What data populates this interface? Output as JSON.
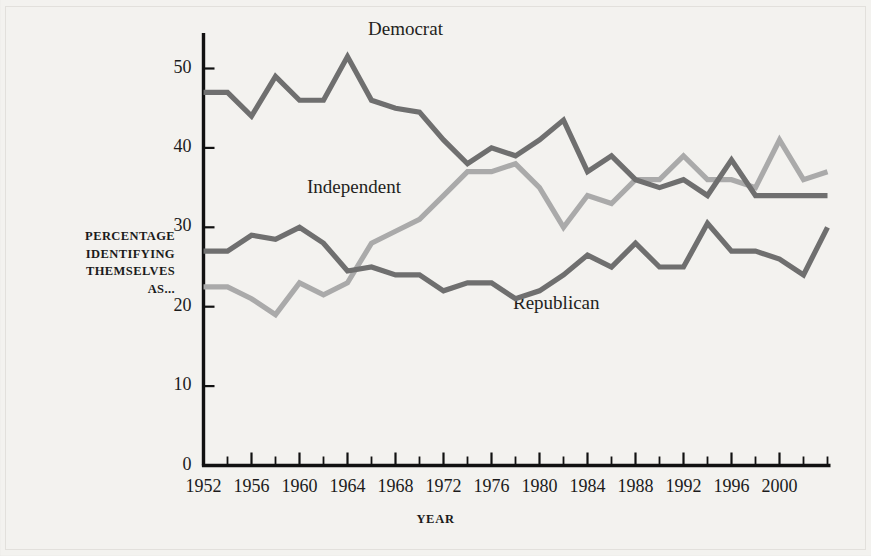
{
  "chart_data": {
    "type": "line",
    "title": "",
    "xlabel": "YEAR",
    "ylabel": "PERCENTAGE IDENTIFYING THEMSELVES AS...",
    "ylabel_lines": [
      "PERCENTAGE",
      "IDENTIFYING",
      "THEMSELVES",
      "AS..."
    ],
    "grid": false,
    "legend_position": "inline-annotations",
    "xlim": [
      1952,
      2004
    ],
    "ylim": [
      0,
      53
    ],
    "yticks": [
      0,
      10,
      20,
      30,
      40,
      50
    ],
    "ytick_labels": [
      "0",
      "10",
      "20",
      "30",
      "40",
      "50"
    ],
    "xtick_labels": [
      "1952",
      "1956",
      "1960",
      "1964",
      "1968",
      "1972",
      "1976",
      "1980",
      "1984",
      "1988",
      "1992",
      "1996",
      "2000"
    ],
    "xtick_label_years": [
      1952,
      1956,
      1960,
      1964,
      1968,
      1972,
      1976,
      1980,
      1984,
      1988,
      1992,
      1996,
      2000
    ],
    "xticks_minor_years": [
      1952,
      1954,
      1956,
      1958,
      1960,
      1962,
      1964,
      1966,
      1968,
      1970,
      1972,
      1974,
      1976,
      1978,
      1980,
      1982,
      1984,
      1986,
      1988,
      1990,
      1992,
      1994,
      1996,
      1998,
      2000,
      2002,
      2004
    ],
    "x": [
      1952,
      1954,
      1956,
      1958,
      1960,
      1962,
      1964,
      1966,
      1968,
      1970,
      1972,
      1974,
      1976,
      1978,
      1980,
      1982,
      1984,
      1986,
      1988,
      1990,
      1992,
      1994,
      1996,
      1998,
      2000,
      2002,
      2004
    ],
    "series": [
      {
        "name": "Democrat",
        "color": "#6f6f6f",
        "values": [
          47,
          47,
          44,
          49,
          46,
          46,
          51.5,
          46,
          45,
          44.5,
          41,
          38,
          40,
          39,
          41,
          43.5,
          37,
          39,
          36,
          35,
          36,
          34,
          38.5,
          34,
          34,
          34,
          34
        ]
      },
      {
        "name": "Independent",
        "color": "#aaaaaa",
        "values": [
          22.5,
          22.5,
          21,
          19,
          23,
          21.5,
          23,
          28,
          29.5,
          31,
          34,
          37,
          37,
          38,
          35,
          30,
          34,
          33,
          36,
          36,
          39,
          36,
          36,
          35,
          41,
          36,
          37
        ]
      },
      {
        "name": "Republican",
        "color": "#6f6f6f",
        "values": [
          27,
          27,
          29,
          28.5,
          30,
          28,
          24.5,
          25,
          24,
          24,
          22,
          23,
          23,
          21,
          22,
          24,
          26.5,
          25,
          28,
          25,
          25,
          30.5,
          27,
          27,
          26,
          24,
          30
        ]
      }
    ],
    "annotations": [
      {
        "text": "Democrat",
        "x": 1966,
        "y": 51
      },
      {
        "text": "Independent",
        "x": 1958,
        "y": 36
      },
      {
        "text": "Republican",
        "x": 1980,
        "y": 22
      }
    ]
  },
  "axis": {
    "x_title": "YEAR",
    "y_title_lines": [
      "PERCENTAGE",
      "IDENTIFYING",
      "THEMSELVES",
      "AS..."
    ]
  },
  "labels": {
    "democrat": "Democrat",
    "independent": "Independent",
    "republican": "Republican"
  },
  "colors": {
    "background": "#f3f2ef",
    "axis": "#111111",
    "democrat": "#6f6f6f",
    "republican": "#6f6f6f",
    "independent": "#aaaaaa",
    "text": "#1b1b1b"
  }
}
